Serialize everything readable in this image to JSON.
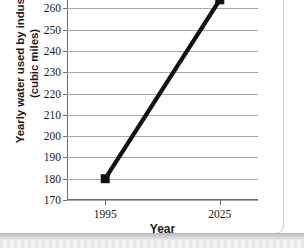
{
  "chart_data": {
    "type": "line",
    "title": "",
    "xlabel": "Year",
    "ylabel_line1": "Yearly water used by industry",
    "ylabel_line2": "(cubic miles)",
    "x": [
      "1995",
      "2025"
    ],
    "x_numeric": [
      1995,
      2025
    ],
    "values": [
      180,
      264
    ],
    "series": [
      {
        "name": "Yearly water used by industry",
        "values": [
          180,
          264
        ]
      }
    ],
    "ylim": [
      170,
      270
    ],
    "xlim": [
      1985,
      2035
    ],
    "yticks": [
      170,
      180,
      190,
      200,
      210,
      220,
      230,
      240,
      250,
      260,
      270
    ],
    "ytick_labels": [
      "170",
      "180",
      "190",
      "200",
      "210",
      "220",
      "230",
      "240",
      "250",
      "260",
      "270"
    ],
    "xticks": [
      1995,
      2025
    ],
    "xtick_labels": [
      "1995",
      "2025"
    ],
    "grid": true,
    "grid_axis": "y",
    "legend": false,
    "legend_position": "none",
    "marker": "square",
    "line_color": "#111111",
    "marker_color": "#111111",
    "grid_color": "#a8a8a8",
    "axis_color": "#6d6d6d",
    "text_color": "#1b1b1b",
    "background": "#ffffff"
  }
}
